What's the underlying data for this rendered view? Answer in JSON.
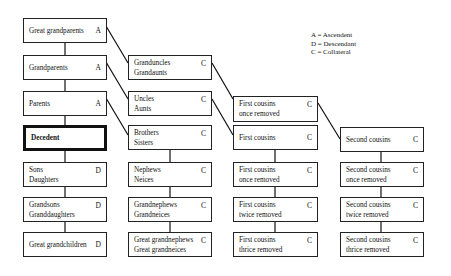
{
  "legend": [
    {
      "key": "A",
      "label": "A = Ascendent"
    },
    {
      "key": "D",
      "label": "D = Descendant"
    },
    {
      "key": "C",
      "label": "C = Collateral"
    }
  ],
  "columns": [
    {
      "name": "direct-line",
      "boxes": [
        {
          "text": "Great grandparents",
          "code": "A"
        },
        {
          "text": "Grandparents",
          "code": "A"
        },
        {
          "text": "Parents",
          "code": "A"
        },
        {
          "text": "Decedent",
          "code": ""
        },
        {
          "text": "Sons\nDaughters",
          "code": "D"
        },
        {
          "text": "Grandsons\nGranddaughters",
          "code": "D"
        },
        {
          "text": "Great grandchildren",
          "code": "D"
        }
      ]
    },
    {
      "name": "siblings-line",
      "boxes": [
        {
          "text": "Granduncles\nGrandaunts",
          "code": "C"
        },
        {
          "text": "Uncles\nAunts",
          "code": "C"
        },
        {
          "text": "Brothers\nSisters",
          "code": "C"
        },
        {
          "text": "Nephews\nNeices",
          "code": "C"
        },
        {
          "text": "Grandnephews\nGrandneices",
          "code": "C"
        },
        {
          "text": "Great grandnephews\nGreat grandneices",
          "code": "C"
        }
      ]
    },
    {
      "name": "first-cousins-line",
      "boxes": [
        {
          "text": "First cousins\nonce removed",
          "code": "C"
        },
        {
          "text": "First cousins",
          "code": "C"
        },
        {
          "text": "First cousins\nonce removed",
          "code": "C"
        },
        {
          "text": "First cousins\ntwice removed",
          "code": "C"
        },
        {
          "text": "First cousins\nthrice removed",
          "code": "C"
        }
      ]
    },
    {
      "name": "second-cousins-line",
      "boxes": [
        {
          "text": "Second cousins",
          "code": "C"
        },
        {
          "text": "Second cousins\nonce removed",
          "code": "C"
        },
        {
          "text": "Second cousins\ntwice removed",
          "code": "C"
        },
        {
          "text": "Second cousins\nthrice removed",
          "code": "C"
        }
      ]
    }
  ]
}
